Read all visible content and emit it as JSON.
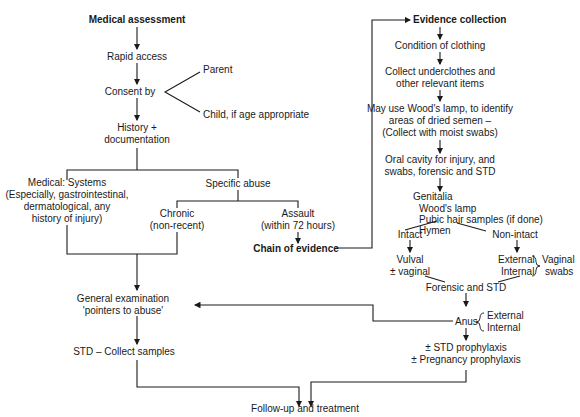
{
  "left": {
    "medical_assessment": "Medical assessment",
    "rapid_access": "Rapid access",
    "consent_by": "Consent by",
    "parent": "Parent",
    "child": "Child, if age appropriate",
    "history_1": "History +",
    "history_2": "documentation",
    "medical_systems": [
      "Medical: Systems",
      "(Especially, gastrointestinal,",
      "dermatological, any",
      "history of injury)"
    ],
    "specific_abuse": "Specific abuse",
    "chronic": [
      "Chronic",
      "(non-recent)"
    ],
    "assault": [
      "Assault",
      "(within 72 hours)"
    ],
    "chain_of_evidence": "Chain of evidence",
    "general_exam": [
      "General examination",
      "'pointers to abuse'"
    ],
    "std_collect": "STD – Collect samples"
  },
  "right": {
    "evidence_collection": "Evidence collection",
    "condition_clothing": "Condition of clothing",
    "collect_under": [
      "Collect underclothes and",
      "other relevant items"
    ],
    "woods_lamp": [
      "May use Wood's lamp, to identify",
      "areas of dried semen –",
      "(Collect with moist swabs)"
    ],
    "oral": [
      "Oral cavity for injury, and",
      "swabs, forensic and STD"
    ],
    "genitalia": "Genitalia",
    "woods_lamp2": "Wood's lamp",
    "pubic_hair": "Pubic hair samples (if done)",
    "hymen": "Hymen",
    "intact": "Intact",
    "non_intact": "Non-intact",
    "vulval": [
      "Vulval",
      "± vaginal"
    ],
    "ext_int": [
      "External",
      "Internal"
    ],
    "vaginal_swabs": [
      "Vaginal",
      "swabs"
    ],
    "forensic_std": "Forensic and STD",
    "anus": "Anus",
    "anus_ext_int": [
      "External",
      "Internal"
    ],
    "prophylaxis": [
      "± STD prophylaxis",
      "± Pregnancy prophylaxis"
    ]
  },
  "bottom": {
    "follow_up": "Follow-up and treatment"
  }
}
